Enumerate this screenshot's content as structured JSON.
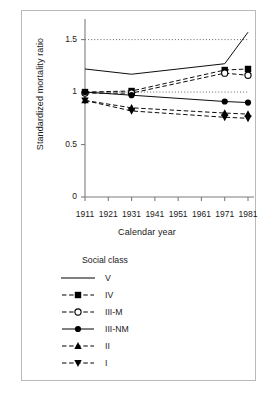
{
  "figure": {
    "background": "#ffffff",
    "frame_color": "#b9b9b9",
    "line_color": "#000000"
  },
  "chart_data": {
    "type": "line",
    "title": "",
    "xlabel": "Calendar year",
    "ylabel": "Standardized mortality ratio",
    "x": [
      1911,
      1931,
      1971,
      1981
    ],
    "xlim": [
      1911,
      1981
    ],
    "ylim": [
      0,
      1.62
    ],
    "xticks": [
      "1911",
      "1921",
      "1931",
      "1941",
      "1951",
      "1961",
      "1971",
      "1981"
    ],
    "xtick_values": [
      1911,
      1921,
      1931,
      1941,
      1951,
      1961,
      1971,
      1981
    ],
    "yticks": [
      "0",
      "0.5",
      "1",
      "1.5"
    ],
    "ytick_values": [
      0,
      0.5,
      1.0,
      1.5
    ],
    "grid": false,
    "reference_lines": [
      {
        "y": 1.5,
        "style": "dotted"
      },
      {
        "y": 1.0,
        "style": "dotted"
      }
    ],
    "legend_position": "below-plot",
    "legend_title": "Social class",
    "series": [
      {
        "name": "V",
        "values": [
          1.22,
          1.17,
          1.27,
          1.57
        ],
        "marker": "none",
        "linestyle": "solid"
      },
      {
        "name": "IV",
        "values": [
          1.0,
          1.01,
          1.21,
          1.22
        ],
        "marker": "filled-square",
        "linestyle": "dashed"
      },
      {
        "name": "III-M",
        "values": [
          0.99,
          0.99,
          1.18,
          1.16
        ],
        "marker": "open-circle",
        "linestyle": "dashed"
      },
      {
        "name": "III-NM",
        "values": [
          1.0,
          0.97,
          0.91,
          0.9
        ],
        "marker": "filled-circle",
        "linestyle": "solid"
      },
      {
        "name": "II",
        "values": [
          0.92,
          0.85,
          0.8,
          0.79
        ],
        "marker": "filled-triangle-up",
        "linestyle": "dashed"
      },
      {
        "name": "I",
        "values": [
          0.92,
          0.82,
          0.76,
          0.75
        ],
        "marker": "filled-triangle-down",
        "linestyle": "dashed"
      }
    ]
  }
}
